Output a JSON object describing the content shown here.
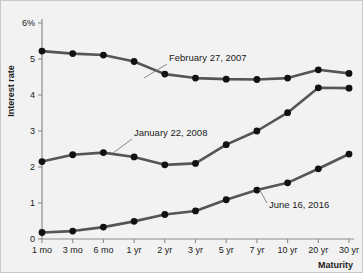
{
  "figure": {
    "background_color": "#f2f2f2",
    "border_color": "#c8c8c8"
  },
  "chart_data": {
    "type": "line",
    "title": "",
    "xlabel": "Maturity",
    "ylabel": "Interest rate",
    "categories": [
      "1 mo",
      "3 mo",
      "6 mo",
      "1 yr",
      "2 yr",
      "3 yr",
      "5 yr",
      "7 yr",
      "10 yr",
      "20 yr",
      "30 yr"
    ],
    "ytick_labels": [
      "0",
      "1",
      "2",
      "3",
      "4",
      "5",
      "6%"
    ],
    "ytick_values": [
      0,
      1,
      2,
      3,
      4,
      5,
      6
    ],
    "ylim": [
      0,
      6
    ],
    "grid": false,
    "legend_position": "inline-annotations",
    "line_color": "#555555",
    "marker_color": "#111111",
    "series": [
      {
        "name": "February 27, 2007",
        "values": [
          5.22,
          5.15,
          5.11,
          4.93,
          4.58,
          4.47,
          4.44,
          4.43,
          4.47,
          4.7,
          4.6
        ]
      },
      {
        "name": "January 22, 2008",
        "values": [
          2.15,
          2.34,
          2.4,
          2.28,
          2.06,
          2.1,
          2.62,
          3.0,
          3.51,
          4.2,
          4.19
        ]
      },
      {
        "name": "June 16, 2016",
        "values": [
          0.18,
          0.22,
          0.33,
          0.49,
          0.68,
          0.78,
          1.09,
          1.36,
          1.56,
          1.95,
          2.36
        ]
      }
    ],
    "annotations": [
      {
        "text": "February 27, 2007",
        "label_x": 168,
        "label_y": 60,
        "leader_from_x": 166,
        "leader_from_y": 63,
        "leader_to_x": 143,
        "leader_to_y": 77
      },
      {
        "text": "January 22, 2008",
        "label_x": 133,
        "label_y": 135,
        "leader_from_x": 131,
        "leader_from_y": 138,
        "leader_to_x": 112,
        "leader_to_y": 152
      },
      {
        "text": "June 16, 2016",
        "label_x": 268,
        "label_y": 207,
        "leader_from_x": 266,
        "leader_from_y": 202,
        "leader_to_x": 258,
        "leader_to_y": 188
      }
    ]
  }
}
